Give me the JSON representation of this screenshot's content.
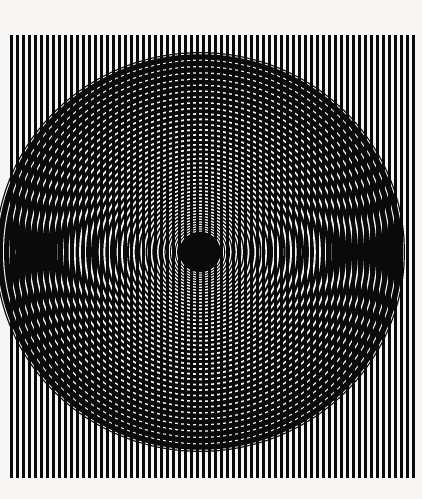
{
  "artwork": {
    "title": "Concentric Moiré Interference",
    "medium": "Op art print",
    "background_color": "#f7f6f4",
    "ink_color": "#0a0a0a",
    "canvas": {
      "width": 422,
      "height": 499
    }
  },
  "stripes": {
    "name": "vertical-line-grating",
    "orientation": "vertical",
    "x_start": 10,
    "x_end": 415,
    "y_start": 35,
    "y_end": 478,
    "period": 6.0,
    "bar_width": 3.1,
    "count": 68,
    "color": "#0a0a0a"
  },
  "rings": {
    "name": "concentric-ellipse-zone-plate",
    "center_x": 200,
    "center_y": 252,
    "radius_x": 205,
    "radius_y": 200,
    "core_radius": 20,
    "core_color": "#0a0a0a",
    "ring_count": 46,
    "zone_constant": 430,
    "min_ring_thickness": 1.15,
    "max_ring_thickness": 9.5,
    "color": "#0a0a0a"
  },
  "chart_data": {
    "type": "scatter",
    "title": "Concentric Moiré Interference",
    "xlabel": "",
    "ylabel": "",
    "grid": false,
    "legend": "none",
    "xlim": [
      0,
      422
    ],
    "ylim": [
      0,
      499
    ],
    "annotations": [
      "Vertical grating period 6 px",
      "Elliptical zone plate centered at (200, 252)",
      "Solid black core radius 20 px"
    ],
    "series": [
      {
        "name": "vertical-stripe-x-positions",
        "values": [
          10,
          16,
          22,
          28,
          34,
          40,
          46,
          52,
          58,
          64,
          70,
          76,
          82,
          88,
          94,
          100,
          106,
          112,
          118,
          124,
          130,
          136,
          142,
          148,
          154,
          160,
          166,
          172,
          178,
          184,
          190,
          196,
          202,
          208,
          214,
          220,
          226,
          232,
          238,
          244,
          250,
          256,
          262,
          268,
          274,
          280,
          286,
          292,
          298,
          304,
          310,
          316,
          322,
          328,
          334,
          340,
          346,
          352,
          358,
          364,
          370,
          376,
          382,
          388,
          394,
          400,
          406,
          412
        ]
      },
      {
        "name": "ring-radii",
        "values": [
          20,
          31,
          40,
          47,
          54,
          60,
          65,
          70,
          75,
          80,
          84,
          88,
          92,
          96,
          99,
          103,
          106,
          109,
          113,
          116,
          119,
          122,
          125,
          127,
          130,
          133,
          136,
          138,
          141,
          143,
          146,
          148,
          151,
          153,
          156,
          158,
          160,
          162,
          165,
          167,
          169,
          171,
          173,
          175,
          177,
          180
        ]
      }
    ]
  }
}
